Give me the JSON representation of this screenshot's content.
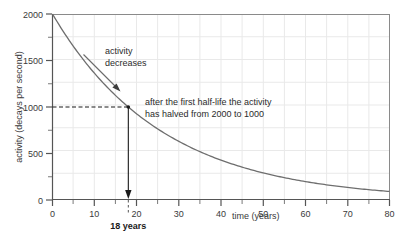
{
  "chart_data": {
    "type": "line",
    "title": "",
    "subtitle": "",
    "xlabel": "time (years)",
    "ylabel": "activity (decays per second)",
    "xlim": [
      0,
      80
    ],
    "ylim": [
      0,
      2000
    ],
    "grid": true,
    "legend": null,
    "x_ticks": [
      0,
      10,
      20,
      30,
      40,
      50,
      60,
      70,
      80
    ],
    "x_tick_labels": [
      "0",
      "10",
      "20",
      "30",
      "40",
      "50",
      "60",
      "70",
      "80"
    ],
    "x_minor_step": 5,
    "y_ticks": [
      0,
      500,
      1000,
      1500,
      2000
    ],
    "y_tick_labels": [
      "0",
      "500",
      "1000",
      "1500",
      "2000"
    ],
    "y_minor_step": 250,
    "series": [
      {
        "name": "activity",
        "kind": "exponential_decay",
        "initial_value": 2000,
        "half_life": 18,
        "color": "#6e6e6e",
        "x": [
          0,
          4,
          8,
          12,
          16,
          18,
          20,
          24,
          28,
          32,
          36,
          40,
          44,
          48,
          52,
          56,
          60,
          64,
          68,
          72,
          76,
          80
        ],
        "y": [
          2000,
          1715,
          1470,
          1260,
          1080,
          1000,
          927,
          795,
          681,
          584,
          500,
          429,
          368,
          315,
          270,
          232,
          199,
          171,
          146,
          125,
          107,
          92
        ]
      }
    ],
    "annotations": [
      {
        "name": "activity-decreases",
        "lines": [
          "activity",
          "decreases"
        ],
        "text": "activity decreases",
        "arrow": "down-right"
      },
      {
        "name": "half-life-note",
        "lines": [
          "after the first half-life the activity",
          "has halved from 2000 to 1000"
        ],
        "text": "after the first half-life the activity has halved from 2000 to 1000"
      },
      {
        "name": "half-life-value",
        "text": "18 years",
        "bold": true,
        "x_value": 18
      }
    ],
    "guides": [
      {
        "name": "half-activity-guide",
        "style": "dashed",
        "from": [
          0,
          1000
        ],
        "to": [
          18,
          1000
        ],
        "value": 1000
      },
      {
        "name": "half-life-arrow",
        "style": "solid-arrow",
        "from": [
          18,
          1000
        ],
        "to": [
          18,
          0
        ],
        "value": 18
      },
      {
        "name": "half-life-tick-guide",
        "style": "dashed",
        "from": [
          18,
          0
        ],
        "to": [
          18,
          -120
        ],
        "value": 18
      }
    ],
    "marker_point": {
      "x": 18,
      "y": 1000
    },
    "colors": {
      "curve": "#6e6e6e",
      "axis": "#555555",
      "grid": "#e8e8e8",
      "text": "#2b2b2b",
      "guide": "#111111"
    }
  }
}
